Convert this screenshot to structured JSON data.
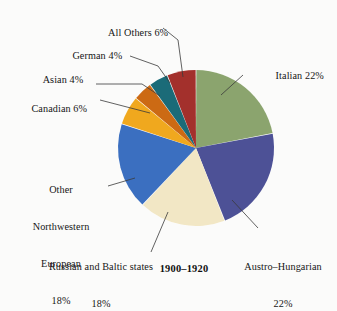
{
  "figure": {
    "caption": "1900–1920",
    "background_color": "#fbfbfa"
  },
  "chart_data": {
    "type": "pie",
    "title": "1900–1920",
    "xlabel": "",
    "ylabel": "",
    "categories": [
      "Italian",
      "Austro–Hungarian",
      "Russian and Baltic states",
      "Other Northwestern European",
      "Canadian",
      "Asian",
      "German",
      "All Others"
    ],
    "values": [
      22,
      22,
      18,
      18,
      6,
      4,
      4,
      6
    ],
    "units": "percent",
    "start_angle_deg": 0,
    "direction": "clockwise",
    "legend": "none",
    "slice_colors": [
      "#8ba46e",
      "#4d5196",
      "#f2e7c5",
      "#3b6fc0",
      "#f0a81e",
      "#cc6a14",
      "#1b6b78",
      "#a3302c"
    ],
    "slice_separator_color": "#ffffff",
    "labels": [
      {
        "text": "Italian 22%",
        "value": 22,
        "color": "#8ba46e"
      },
      {
        "text": "Austro–Hungarian\n22%",
        "value": 22,
        "color": "#4d5196"
      },
      {
        "text": "Russian and Baltic states\n18%",
        "value": 18,
        "color": "#f2e7c5"
      },
      {
        "text": "Other\nNorthwestern\nEuropean\n18%",
        "value": 18,
        "color": "#3b6fc0"
      },
      {
        "text": "Canadian 6%",
        "value": 6,
        "color": "#f0a81e"
      },
      {
        "text": "Asian 4%",
        "value": 4,
        "color": "#cc6a14"
      },
      {
        "text": "German 4%",
        "value": 4,
        "color": "#1b6b78"
      },
      {
        "text": "All Others 6%",
        "value": 6,
        "color": "#a3302c"
      }
    ]
  },
  "annotations": {
    "italian": "Italian 22%",
    "austro_hungarian_line1": "Austro–Hungarian",
    "austro_hungarian_line2": "22%",
    "russian_baltic_line1": "Russian and Baltic states",
    "russian_baltic_line2": "18%",
    "other_nw_european_line1": "Other",
    "other_nw_european_line2": "Northwestern",
    "other_nw_european_line3": "European",
    "other_nw_european_line4": "18%",
    "canadian": "Canadian 6%",
    "asian": "Asian 4%",
    "german": "German 4%",
    "all_others": "All Others 6%"
  }
}
